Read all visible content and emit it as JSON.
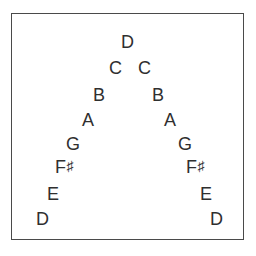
{
  "diagram": {
    "frame": {
      "border_color": "#4a4a4a",
      "background_color": "#ffffff"
    },
    "note_color": "#2f2f2f",
    "ascending_label": "ascending",
    "descending_label": "descending",
    "notes": [
      {
        "id": "asc-d-low",
        "letter": "D",
        "accidental": "",
        "side": "left",
        "x": 36,
        "y": 210
      },
      {
        "id": "asc-e",
        "letter": "E",
        "accidental": "",
        "side": "left",
        "x": 47,
        "y": 185
      },
      {
        "id": "asc-fs",
        "letter": "F",
        "accidental": "♯",
        "side": "left",
        "x": 55,
        "y": 158
      },
      {
        "id": "asc-g",
        "letter": "G",
        "accidental": "",
        "side": "left",
        "x": 66,
        "y": 135
      },
      {
        "id": "asc-a",
        "letter": "A",
        "accidental": "",
        "side": "left",
        "x": 82,
        "y": 111
      },
      {
        "id": "asc-b",
        "letter": "B",
        "accidental": "",
        "side": "left",
        "x": 93,
        "y": 86
      },
      {
        "id": "asc-c",
        "letter": "C",
        "accidental": "",
        "side": "left",
        "x": 109,
        "y": 59
      },
      {
        "id": "peak-d",
        "letter": "D",
        "accidental": "",
        "side": "peak",
        "x": 121,
        "y": 33
      },
      {
        "id": "desc-c",
        "letter": "C",
        "accidental": "",
        "side": "right",
        "x": 138,
        "y": 59
      },
      {
        "id": "desc-b",
        "letter": "B",
        "accidental": "",
        "side": "right",
        "x": 152,
        "y": 86
      },
      {
        "id": "desc-a",
        "letter": "A",
        "accidental": "",
        "side": "right",
        "x": 164,
        "y": 111
      },
      {
        "id": "desc-g",
        "letter": "G",
        "accidental": "",
        "side": "right",
        "x": 178,
        "y": 135
      },
      {
        "id": "desc-fs",
        "letter": "F",
        "accidental": "♯",
        "side": "right",
        "x": 186,
        "y": 158
      },
      {
        "id": "desc-e",
        "letter": "E",
        "accidental": "",
        "side": "right",
        "x": 200,
        "y": 185
      },
      {
        "id": "desc-d-low",
        "letter": "D",
        "accidental": "",
        "side": "right",
        "x": 210,
        "y": 210
      }
    ]
  }
}
